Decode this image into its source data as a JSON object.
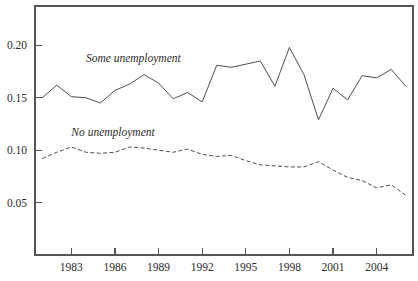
{
  "chart_data": {
    "type": "line",
    "title": "",
    "subtitle": "",
    "xlabel": "",
    "ylabel": "",
    "xlim": [
      1980.5,
      2006.5
    ],
    "ylim": [
      0.0,
      0.2375
    ],
    "grid": false,
    "legend_position": "inline-annotation",
    "x_tick_labels": [
      "1983",
      "1986",
      "1989",
      "1992",
      "1995",
      "1998",
      "2001",
      "2004"
    ],
    "x_ticks": [
      1983,
      1986,
      1989,
      1992,
      1995,
      1998,
      2001,
      2004
    ],
    "y_tick_labels": [
      "0.20",
      "0.15",
      "0.10",
      "0.05"
    ],
    "y_ticks": [
      0.2,
      0.15,
      0.1,
      0.05
    ],
    "x": [
      1981,
      1982,
      1983,
      1984,
      1985,
      1986,
      1987,
      1988,
      1989,
      1990,
      1991,
      1992,
      1993,
      1994,
      1995,
      1996,
      1997,
      1998,
      1999,
      2000,
      2001,
      2002,
      2003,
      2004,
      2005,
      2006
    ],
    "series": [
      {
        "name": "Some unemployment",
        "style": "solid",
        "label_x": 1984.0,
        "label_y": 0.1845,
        "values": [
          0.15,
          0.162,
          0.151,
          0.15,
          0.145,
          0.157,
          0.163,
          0.172,
          0.164,
          0.149,
          0.155,
          0.146,
          0.181,
          0.179,
          0.182,
          0.185,
          0.161,
          0.198,
          0.172,
          0.129,
          0.159,
          0.148,
          0.171,
          0.169,
          0.177,
          0.161
        ]
      },
      {
        "name": "No unemployment",
        "style": "dashed",
        "label_x": 1983.0,
        "label_y": 0.1135,
        "values": [
          0.092,
          0.098,
          0.103,
          0.098,
          0.097,
          0.098,
          0.103,
          0.102,
          0.1,
          0.098,
          0.101,
          0.096,
          0.094,
          0.095,
          0.09,
          0.086,
          0.085,
          0.084,
          0.084,
          0.089,
          0.081,
          0.074,
          0.071,
          0.064,
          0.067,
          0.057
        ]
      }
    ],
    "annotations": [
      {
        "text": "Some unemployment"
      },
      {
        "text": "No unemployment"
      }
    ]
  },
  "figure": {
    "background_color": "#ffffff",
    "axis_color": "#555555",
    "line_color": "#3a3a3a"
  }
}
